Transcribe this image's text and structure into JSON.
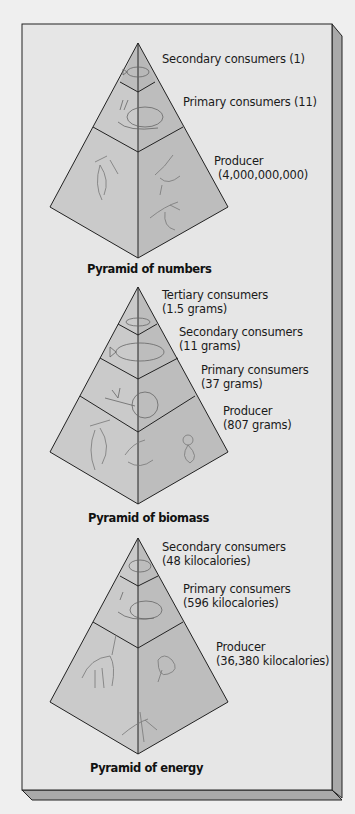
{
  "colors": {
    "background": "#efefef",
    "panel_face": "#e6e6e6",
    "panel_side": "#a9a9a9",
    "pyramid_left_face": "#cacaca",
    "pyramid_right_face": "#bdbdbd",
    "outline": "#222222"
  },
  "pyramids": [
    {
      "title": "Pyramid of numbers",
      "levels": [
        {
          "name": "Secondary consumers",
          "line1": "Secondary consumers (1)",
          "line2": "",
          "value": "1",
          "icon": "fish-icon"
        },
        {
          "name": "Primary consumers",
          "line1": "Primary consumers (11)",
          "line2": "",
          "value": "11",
          "icon": "snail-icon"
        },
        {
          "name": "Producer",
          "line1": "Producer",
          "line2": "(4,000,000,000)",
          "value": "4,000,000,000",
          "icon": "plankton-icon"
        }
      ]
    },
    {
      "title": "Pyramid of biomass",
      "levels": [
        {
          "name": "Tertiary consumers",
          "line1": "Tertiary consumers",
          "line2": "(1.5 grams)",
          "value": "1.5 grams",
          "icon": "fish-icon"
        },
        {
          "name": "Secondary consumers",
          "line1": "Secondary consumers",
          "line2": "(11 grams)",
          "value": "11 grams",
          "icon": "fish-icon"
        },
        {
          "name": "Primary consumers",
          "line1": "Primary consumers",
          "line2": "(37 grams)",
          "value": "37 grams",
          "icon": "snail-icon"
        },
        {
          "name": "Producer",
          "line1": "Producer",
          "line2": "(807 grams)",
          "value": "807 grams",
          "icon": "plankton-icon"
        }
      ]
    },
    {
      "title": "Pyramid of energy",
      "levels": [
        {
          "name": "Secondary consumers",
          "line1": "Secondary consumers",
          "line2": "(48 kilocalories)",
          "value": "48 kilocalories",
          "icon": "fish-icon"
        },
        {
          "name": "Primary consumers",
          "line1": "Primary consumers",
          "line2": "(596 kilocalories)",
          "value": "596 kilocalories",
          "icon": "snail-icon"
        },
        {
          "name": "Producer",
          "line1": "Producer",
          "line2": "(36,380 kilocalories)",
          "value": "36,380 kilocalories",
          "icon": "plankton-icon"
        }
      ]
    }
  ]
}
